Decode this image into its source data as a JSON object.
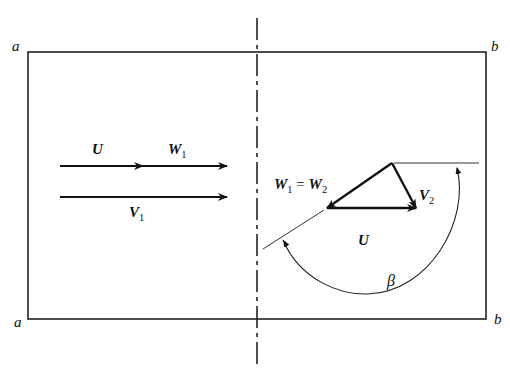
{
  "diagram": {
    "corner_labels": {
      "top_left": "a",
      "top_right": "b",
      "bottom_left": "a",
      "bottom_right": "b"
    },
    "left_panel": {
      "label_U": "U",
      "label_W1": "W",
      "label_W1_sub": "1",
      "label_V1": "V",
      "label_V1_sub": "1"
    },
    "right_panel": {
      "label_W1": "W",
      "label_W1_sub": "1",
      "equals": " = ",
      "label_W2": "W",
      "label_W2_sub": "2",
      "label_V2": "V",
      "label_V2_sub": "2",
      "label_U": "U",
      "label_beta": "β"
    },
    "colors": {
      "line": "#111111",
      "background": "#ffffff"
    }
  }
}
